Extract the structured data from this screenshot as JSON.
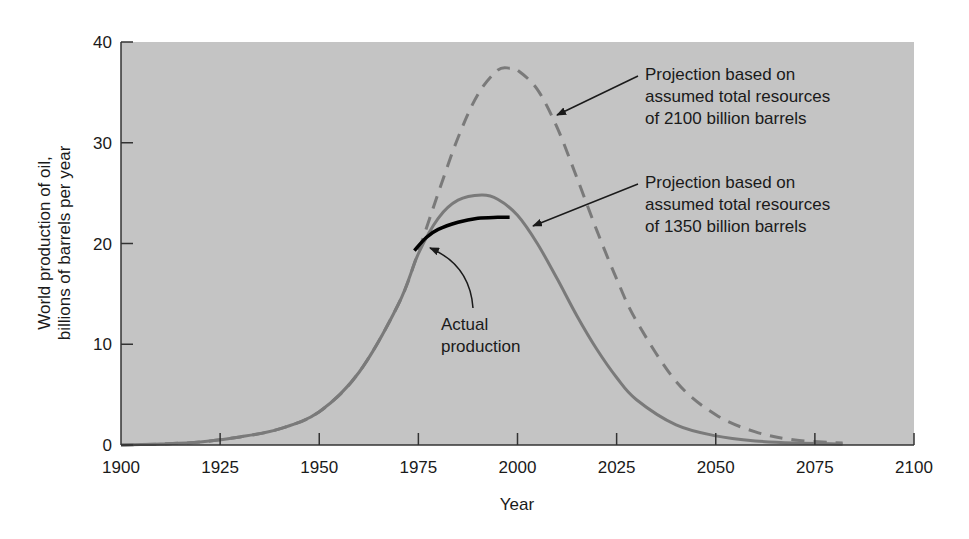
{
  "chart_data": {
    "type": "line",
    "title": "",
    "xlabel": "Year",
    "ylabel_lines": [
      "World production of oil,",
      "billions of barrels per year"
    ],
    "xlim": [
      1900,
      2100
    ],
    "ylim": [
      0,
      40
    ],
    "x_ticks": [
      1900,
      1925,
      1950,
      1975,
      2000,
      2025,
      2050,
      2075,
      2100
    ],
    "y_ticks": [
      0,
      10,
      20,
      30,
      40
    ],
    "grid": false,
    "background": "#c4c4c4",
    "series": [
      {
        "name": "Projection based on assumed total resources of 2100 billion barrels",
        "style": "dashed",
        "color": "#7a7a7a",
        "x": [
          1900,
          1910,
          1920,
          1930,
          1940,
          1950,
          1960,
          1970,
          1975,
          1980,
          1985,
          1990,
          1995,
          1998,
          2000,
          2005,
          2010,
          2015,
          2020,
          2025,
          2030,
          2040,
          2050,
          2060,
          2070,
          2082
        ],
        "y": [
          0,
          0.1,
          0.3,
          0.8,
          1.6,
          3.3,
          7.2,
          14.0,
          19.2,
          25.0,
          30.5,
          34.8,
          37.2,
          37.4,
          37.2,
          35.3,
          31.5,
          26.5,
          21.3,
          16.5,
          12.3,
          6.3,
          3.0,
          1.3,
          0.5,
          0.2
        ]
      },
      {
        "name": "Projection based on assumed total resources of 1350 billion barrels",
        "style": "solid",
        "color": "#7a7a7a",
        "x": [
          1900,
          1910,
          1920,
          1930,
          1940,
          1950,
          1960,
          1970,
          1975,
          1980,
          1985,
          1991,
          1995,
          2000,
          2005,
          2010,
          2015,
          2020,
          2025,
          2030,
          2040,
          2050,
          2060,
          2070,
          2082
        ],
        "y": [
          0,
          0.1,
          0.3,
          0.8,
          1.6,
          3.3,
          7.2,
          14.0,
          19.0,
          22.5,
          24.3,
          24.8,
          24.4,
          22.8,
          20.0,
          16.5,
          12.8,
          9.5,
          6.7,
          4.5,
          2.0,
          0.9,
          0.4,
          0.2,
          0.1
        ]
      },
      {
        "name": "Actual production",
        "style": "solid",
        "color": "#000000",
        "x": [
          1974,
          1977,
          1980,
          1985,
          1990,
          1995,
          1998
        ],
        "y": [
          19.3,
          20.6,
          21.4,
          22.1,
          22.5,
          22.6,
          22.6
        ]
      }
    ],
    "annotations": [
      {
        "lines": [
          "Projection based on",
          "assumed total resources",
          "of 2100 billion barrels"
        ],
        "points_to": [
          2010,
          33
        ]
      },
      {
        "lines": [
          "Projection based on",
          "assumed total resources",
          "of 1350 billion barrels"
        ],
        "points_to": [
          2004,
          21.5
        ]
      },
      {
        "lines": [
          "Actual",
          "production"
        ],
        "points_to": [
          1977,
          19.7
        ]
      }
    ]
  }
}
